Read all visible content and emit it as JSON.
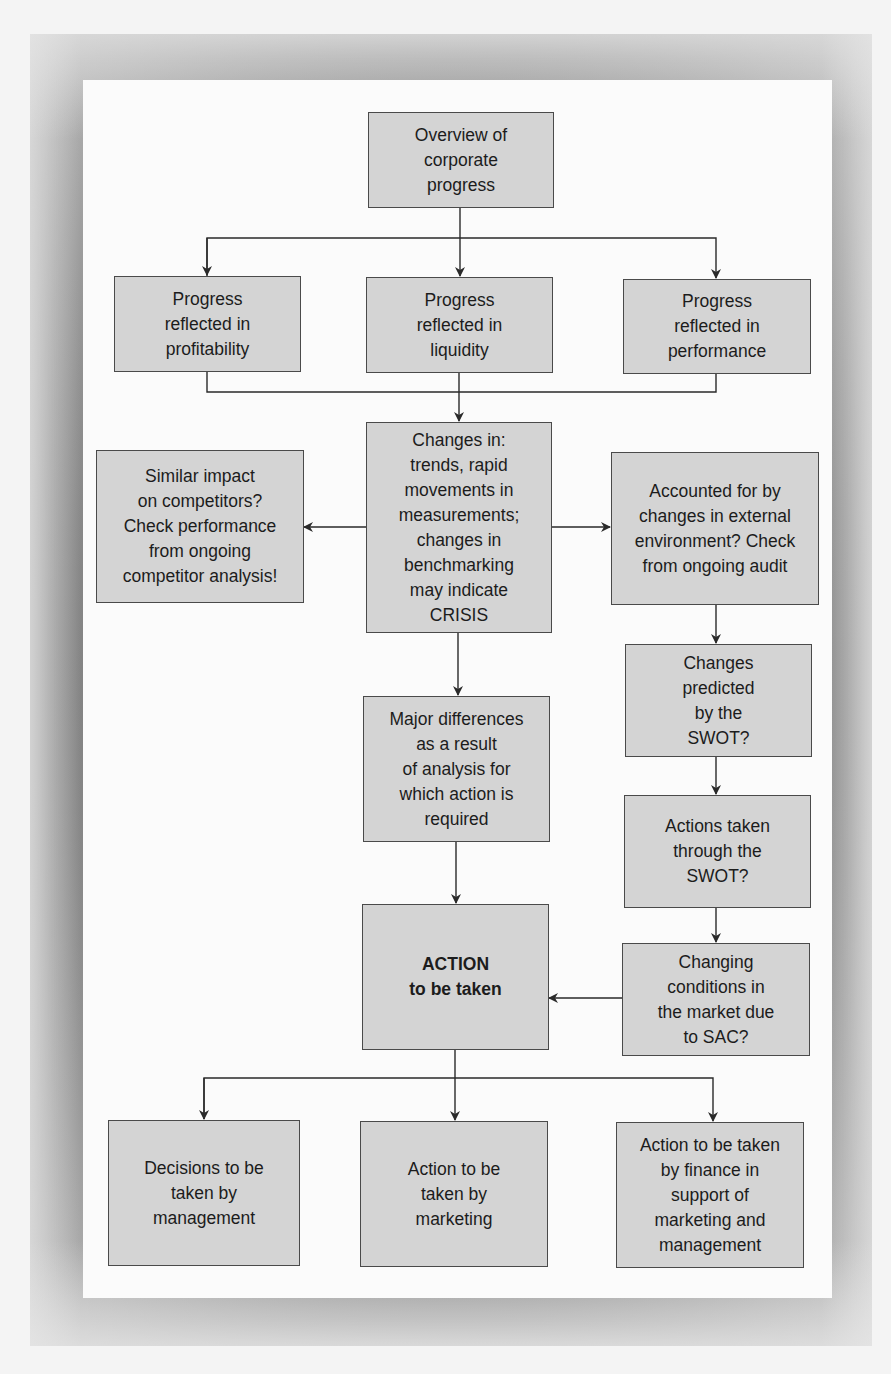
{
  "diagram": {
    "colors": {
      "box_fill": "#d4d4d4",
      "box_border": "#4a4a4a",
      "line": "#2a2a2a",
      "panel": "#fbfbfb",
      "frame": "#6e6e6e"
    },
    "nodes": {
      "overview": {
        "label": "Overview of\ncorporate\nprogress"
      },
      "profitability": {
        "label": "Progress\nreflected in\nprofitability"
      },
      "liquidity": {
        "label": "Progress\nreflected in\nliquidity"
      },
      "performance": {
        "label": "Progress\nreflected in\nperformance"
      },
      "changes": {
        "label": "Changes in:\ntrends, rapid\nmovements in\nmeasurements;\nchanges in\nbenchmarking\nmay indicate\nCRISIS"
      },
      "competitors": {
        "label": "Similar impact\non competitors?\nCheck performance\nfrom ongoing\ncompetitor analysis!"
      },
      "external": {
        "label": "Accounted for by\nchanges in external\nenvironment? Check\nfrom ongoing audit"
      },
      "swot_predicted": {
        "label": "Changes\npredicted\nby the\nSWOT?"
      },
      "major_differences": {
        "label": "Major differences\nas a result\nof analysis for\nwhich action is\nrequired"
      },
      "swot_actions": {
        "label": "Actions taken\nthrough the\nSWOT?"
      },
      "action": {
        "label": "ACTION\nto be taken"
      },
      "market_conditions": {
        "label": "Changing\nconditions in\nthe market due\nto SAC?"
      },
      "management": {
        "label": "Decisions to be\ntaken by\nmanagement"
      },
      "marketing": {
        "label": "Action to be\ntaken by\nmarketing"
      },
      "finance": {
        "label": "Action to be taken\nby finance in\nsupport of\nmarketing and\nmanagement"
      }
    },
    "edges": [
      [
        "overview",
        "profitability"
      ],
      [
        "overview",
        "liquidity"
      ],
      [
        "overview",
        "performance"
      ],
      [
        "profitability",
        "changes"
      ],
      [
        "liquidity",
        "changes"
      ],
      [
        "performance",
        "changes"
      ],
      [
        "changes",
        "competitors"
      ],
      [
        "changes",
        "external"
      ],
      [
        "changes",
        "major_differences"
      ],
      [
        "external",
        "swot_predicted"
      ],
      [
        "swot_predicted",
        "swot_actions"
      ],
      [
        "swot_actions",
        "market_conditions"
      ],
      [
        "market_conditions",
        "action"
      ],
      [
        "major_differences",
        "action"
      ],
      [
        "action",
        "management"
      ],
      [
        "action",
        "marketing"
      ],
      [
        "action",
        "finance"
      ]
    ]
  }
}
